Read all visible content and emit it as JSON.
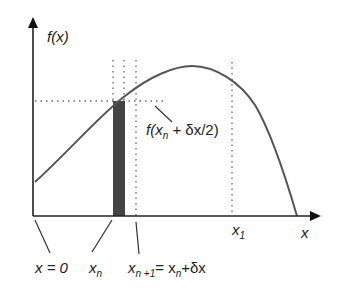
{
  "figure": {
    "type": "diagram",
    "colors": {
      "axis": "#222222",
      "curve": "#555555",
      "strip": "#444444",
      "guides": "#666666"
    }
  },
  "labels": {
    "y_axis": "f(x)",
    "x_axis": "x",
    "x_zero": "x = 0",
    "x_n": "x",
    "x_n_sub": "n",
    "x_n1": "x",
    "x_n1_sub": "n +1",
    "x_n1_eq": "= x",
    "x_n1_eq_sub": "n",
    "x_n1_tail": "+δx",
    "x_1": "x",
    "x_1_sub": "1",
    "midpoint_f": "f(x",
    "midpoint_sub": "n",
    "midpoint_tail": " + δx/2)"
  }
}
